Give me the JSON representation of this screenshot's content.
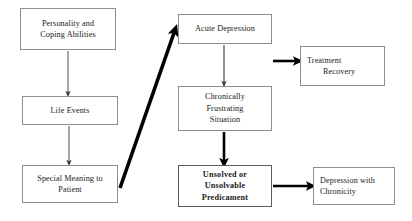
{
  "diagram": {
    "background_color": "#ffffff",
    "box_border_color": "#8e8e8e",
    "text_color": "#1a1a1a",
    "arrow_color": "#000000",
    "nodes": [
      {
        "id": "personality",
        "line1": "Personality and",
        "line2": "Coping Abilities",
        "emphasis": "normal"
      },
      {
        "id": "life_events",
        "line1": "Life Events",
        "emphasis": "normal"
      },
      {
        "id": "special_meaning",
        "line1": "Special Meaning to",
        "line2": "Patient",
        "emphasis": "normal"
      },
      {
        "id": "acute_depression",
        "line1": "Acute Depression",
        "emphasis": "normal"
      },
      {
        "id": "chronically_frustrating",
        "line1": "Chronically",
        "line2": "Frustrating",
        "line3": "Situation",
        "emphasis": "normal"
      },
      {
        "id": "unsolved_predicament",
        "line1": "Unsolved or",
        "line2": "Unsolvable",
        "line3": "Predicament",
        "emphasis": "bold"
      },
      {
        "id": "treatment_recovery",
        "line1": "Treatment",
        "line2": "Recovery",
        "emphasis": "normal"
      },
      {
        "id": "depression_chronicity",
        "line1": "Depression with",
        "line2": "Chronicity",
        "emphasis": "normal"
      }
    ],
    "edges": [
      {
        "id": "personality-to-life",
        "from": "personality",
        "to": "life_events",
        "weight": "thin",
        "direction": "down"
      },
      {
        "id": "life-to-special",
        "from": "life_events",
        "to": "special_meaning",
        "weight": "thin",
        "direction": "down"
      },
      {
        "id": "special-to-acute",
        "from": "special_meaning",
        "to": "acute_depression",
        "weight": "thick",
        "direction": "diagonal-up-right"
      },
      {
        "id": "acute-to-chronic",
        "from": "acute_depression",
        "to": "chronically_frustrating",
        "weight": "thin",
        "direction": "down"
      },
      {
        "id": "acute-to-treatment",
        "from": "acute_depression",
        "to": "treatment_recovery",
        "weight": "thick",
        "direction": "right"
      },
      {
        "id": "chronic-to-unsolved",
        "from": "chronically_frustrating",
        "to": "unsolved_predicament",
        "weight": "thick",
        "direction": "down"
      },
      {
        "id": "unsolved-to-depchron",
        "from": "unsolved_predicament",
        "to": "depression_chronicity",
        "weight": "thick",
        "direction": "right"
      }
    ]
  }
}
